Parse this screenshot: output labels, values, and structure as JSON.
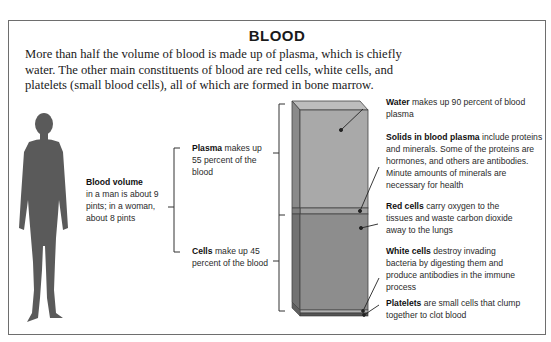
{
  "title": "BLOOD",
  "intro": "More than half the volume of blood is made up of plasma, which is chiefly water. The other main constituents of blood are red cells, white cells, and platelets (small blood cells), all of which are formed in bone marrow.",
  "figure": {
    "icon": "human-silhouette-icon",
    "blood_volume": {
      "heading": "Blood volume",
      "text": "in a man is about 9 pints; in a woman, about 8 pints"
    }
  },
  "proportions": {
    "plasma": {
      "heading": "Plasma",
      "text": "makes up 55 percent of the blood"
    },
    "cells": {
      "heading": "Cells",
      "text": "make up 45 percent of the blood"
    }
  },
  "components": {
    "water": {
      "heading": "Water",
      "text": "makes up 90 percent of blood plasma"
    },
    "solids": {
      "heading": "Solids in blood plasma",
      "text": "include proteins and minerals. Some of the proteins are hormones, and others are antibodies. Minute amounts of minerals are necessary for health"
    },
    "red_cells": {
      "heading": "Red cells",
      "text": "carry oxygen to the tissues and waste carbon dioxide away to the lungs"
    },
    "white_cells": {
      "heading": "White cells",
      "text": "destroy invading bacteria by digesting them and produce antibodies in the immune process"
    },
    "platelets": {
      "heading": "Platelets",
      "text": "are small cells that clump together to clot blood"
    }
  },
  "colors": {
    "plasma_front": "#a9a9a9",
    "plasma_side": "#8a8a8a",
    "plasma_top": "#bdbdbd",
    "cells_front": "#8d8d8d",
    "cells_side": "#727272",
    "silhouette": "#5a5a5a",
    "frame": "#6e6e6e"
  }
}
